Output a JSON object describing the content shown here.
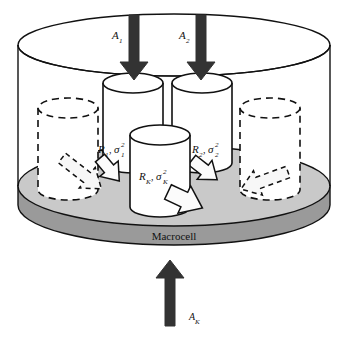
{
  "figure": {
    "macrocell_label": "Macrocell",
    "colors": {
      "outline": "#111111",
      "base_top_fill": "#c9c9c9",
      "base_side_fill": "#9a9a9a",
      "arrow_dark": "#333333",
      "cylinder_fill": "#ffffff",
      "white_arrow_fill": "#f5f5f5"
    }
  },
  "arrivals": [
    {
      "id": "A1",
      "label": "A",
      "sub": "1",
      "direction": "down"
    },
    {
      "id": "A2",
      "label": "A",
      "sub": "2",
      "direction": "down"
    },
    {
      "id": "AK",
      "label": "A",
      "sub": "K",
      "direction": "up"
    }
  ],
  "cells": [
    {
      "id": "cell1",
      "rate": "R",
      "rate_sub": "1",
      "sigma": "σ",
      "sigma_sub": "1",
      "sigma_sup": "2",
      "style": "solid"
    },
    {
      "id": "cell2",
      "rate": "R",
      "rate_sub": "2",
      "sigma": "σ",
      "sigma_sub": "2",
      "sigma_sup": "2",
      "style": "solid"
    },
    {
      "id": "cellK",
      "rate": "R",
      "rate_sub": "K",
      "sigma": "σ",
      "sigma_sub": "K",
      "sigma_sup": "2",
      "style": "solid"
    }
  ],
  "dashed_cells": [
    {
      "id": "dashed-left",
      "style": "dashed"
    },
    {
      "id": "dashed-right",
      "style": "dashed"
    }
  ],
  "service_arrows": [
    {
      "id": "arrow-left-dashed",
      "style": "dashed",
      "direction": "down-right"
    },
    {
      "id": "arrow-left-solid",
      "style": "solid",
      "direction": "down-right"
    },
    {
      "id": "arrow-center-solid",
      "style": "solid",
      "direction": "down-right"
    },
    {
      "id": "arrow-right-solid",
      "style": "solid",
      "direction": "down-right"
    },
    {
      "id": "arrow-right-dashed",
      "style": "dashed",
      "direction": "down-left"
    }
  ]
}
